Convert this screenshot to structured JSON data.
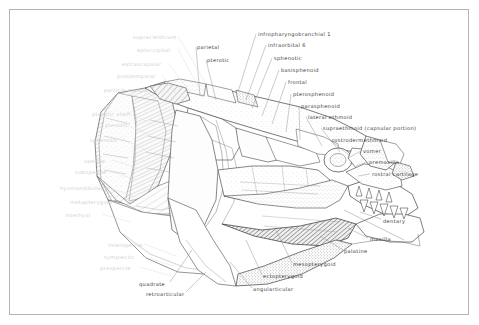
{
  "figure": {
    "kind": "anatomical-line-drawing",
    "style": "pen-and-ink stipple and hatch",
    "border_color": "#b4b4b4",
    "background_color": "#ffffff",
    "ink_color": "#3a3a3a",
    "faded_label_color": "#cfcfcf"
  },
  "labels_right": [
    {
      "id": "infrapharyngobranchial-1",
      "text": "infropharyngobranchial  1",
      "x": 258,
      "y": 32
    },
    {
      "id": "infraorbital-6",
      "text": "infraorbital  6",
      "x": 268,
      "y": 43
    },
    {
      "id": "sphenotic",
      "text": "sphenotic",
      "x": 274,
      "y": 56
    },
    {
      "id": "basisphenoid",
      "text": "basisphenoid",
      "x": 281,
      "y": 68
    },
    {
      "id": "frontal",
      "text": "frontal",
      "x": 288,
      "y": 80
    },
    {
      "id": "pterosphenoid",
      "text": "pterosphenoid",
      "x": 293,
      "y": 92
    },
    {
      "id": "parasphenoid",
      "text": "parasphenoid",
      "x": 301,
      "y": 104
    },
    {
      "id": "lateral-ethmoid",
      "text": "lateral  ethmoid",
      "x": 308,
      "y": 115
    },
    {
      "id": "supraethmoid-capsular-portion",
      "text": "supraethmoid  (capsular  portion)",
      "x": 323,
      "y": 126
    },
    {
      "id": "rostrodermethmoid",
      "text": "rostrodermethmoid",
      "x": 332,
      "y": 138
    },
    {
      "id": "vomer",
      "text": "vomer",
      "x": 363,
      "y": 149
    },
    {
      "id": "premaxilla",
      "text": "premaxilla",
      "x": 369,
      "y": 160
    },
    {
      "id": "rostral-cartilage",
      "text": "rostral  cartilage",
      "x": 372,
      "y": 172
    },
    {
      "id": "dentary",
      "text": "dentary",
      "x": 383,
      "y": 219
    },
    {
      "id": "maxilla",
      "text": "maxilla",
      "x": 370,
      "y": 237
    }
  ],
  "labels_top": [
    {
      "id": "parietal",
      "text": "parietal",
      "x": 197,
      "y": 45
    },
    {
      "id": "pterotic",
      "text": "pterotic",
      "x": 207,
      "y": 58
    }
  ],
  "labels_bottom": [
    {
      "id": "palatine",
      "text": "palatine",
      "x": 344,
      "y": 249
    },
    {
      "id": "mesopterygoid",
      "text": "mesopterygoid",
      "x": 293,
      "y": 262
    },
    {
      "id": "ectopterygoid",
      "text": "ectopterygoid",
      "x": 263,
      "y": 274
    },
    {
      "id": "angularticular",
      "text": "angularticular",
      "x": 253,
      "y": 287
    },
    {
      "id": "quadrate",
      "text": "quadrate",
      "x": 139,
      "y": 282
    },
    {
      "id": "retroarticular",
      "text": "retroarticular",
      "x": 146,
      "y": 292
    }
  ],
  "labels_left_faded": [
    {
      "id": "supracleithrum",
      "text": "supracleithrum",
      "x": 133,
      "y": 35
    },
    {
      "id": "epioccipital",
      "text": "epioccipital",
      "x": 137,
      "y": 48
    },
    {
      "id": "extrascapular",
      "text": "extrascapular",
      "x": 122,
      "y": 62
    },
    {
      "id": "posttemporal",
      "text": "posttemporal",
      "x": 117,
      "y": 74
    },
    {
      "id": "particle-margin",
      "text": "particle margin",
      "x": 104,
      "y": 88
    },
    {
      "id": "pterotic-shelf",
      "text": "pterotic shelf",
      "x": 92,
      "y": 112
    },
    {
      "id": "pterotic",
      "text": "pterotic",
      "x": 105,
      "y": 123
    },
    {
      "id": "sphenotic-lower",
      "text": "sphenotic",
      "x": 90,
      "y": 138
    },
    {
      "id": "opercle",
      "text": "opercle",
      "x": 84,
      "y": 159
    },
    {
      "id": "subopercle",
      "text": "subopercle",
      "x": 75,
      "y": 170
    },
    {
      "id": "hyomandibular",
      "text": "hyomandibular",
      "x": 60,
      "y": 186
    },
    {
      "id": "metapterygoid",
      "text": "metapterygoid",
      "x": 70,
      "y": 200
    },
    {
      "id": "interhyal",
      "text": "interhyal",
      "x": 65,
      "y": 213
    },
    {
      "id": "interopercle",
      "text": "interopercle",
      "x": 108,
      "y": 243
    },
    {
      "id": "symplectic",
      "text": "symplectic",
      "x": 104,
      "y": 255
    },
    {
      "id": "preopercle",
      "text": "preopercle",
      "x": 100,
      "y": 266
    }
  ]
}
